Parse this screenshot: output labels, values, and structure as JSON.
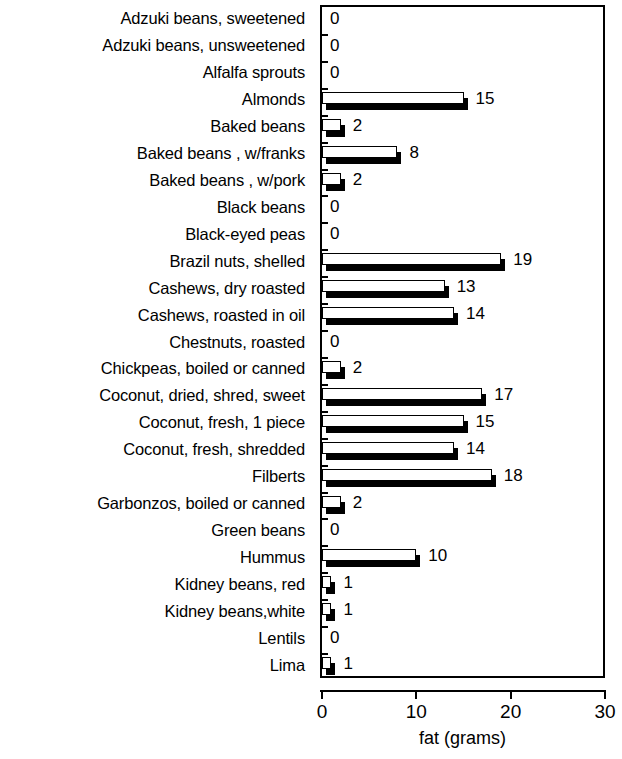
{
  "chart_data": {
    "type": "bar",
    "orientation": "horizontal",
    "title": "",
    "xlabel": "fat (grams)",
    "ylabel": "",
    "xlim": [
      0,
      30
    ],
    "xticks": [
      "0",
      "10",
      "20",
      "30"
    ],
    "xtick_values": [
      0,
      10,
      20,
      30
    ],
    "grid": false,
    "legend": null,
    "data_labels": true,
    "categories": [
      "Adzuki beans, sweetened",
      "Adzuki beans, unsweetened",
      "Alfalfa sprouts",
      "Almonds",
      "Baked beans",
      "Baked beans , w/franks",
      "Baked beans , w/pork",
      "Black beans",
      "Black-eyed peas",
      "Brazil nuts, shelled",
      "Cashews, dry roasted",
      "Cashews, roasted in oil",
      "Chestnuts, roasted",
      "Chickpeas, boiled or canned",
      "Coconut, dried, shred, sweet",
      "Coconut, fresh, 1 piece",
      "Coconut, fresh, shredded",
      "Filberts",
      "Garbonzos, boiled or canned",
      "Green beans",
      "Hummus",
      "Kidney beans, red",
      "Kidney beans,white",
      "Lentils",
      "Lima"
    ],
    "values": [
      0,
      0,
      0,
      15,
      2,
      8,
      2,
      0,
      0,
      19,
      13,
      14,
      0,
      2,
      17,
      15,
      14,
      18,
      2,
      0,
      10,
      1,
      1,
      0,
      1
    ],
    "value_labels": [
      "0",
      "0",
      "0",
      "15",
      "2",
      "8",
      "2",
      "0",
      "0",
      "19",
      "13",
      "14",
      "0",
      "2",
      "17",
      "15",
      "14",
      "18",
      "2",
      "0",
      "10",
      "1",
      "1",
      "0",
      "1"
    ]
  },
  "style": {
    "bar_face_color": "#ffffff",
    "bar_edge_color": "#000000",
    "bar_shadow_color": "#000000",
    "background_color": "#ffffff",
    "axis_color": "#000000"
  }
}
